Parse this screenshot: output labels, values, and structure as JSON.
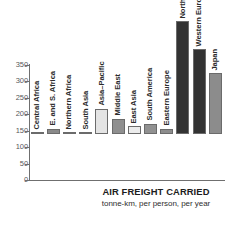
{
  "chart_data": {
    "type": "bar",
    "title": "AIR FREIGHT CARRIED",
    "subtitle": "tonne-km, per person, per year",
    "xlabel": "",
    "ylabel": "",
    "ylim": [
      0,
      350
    ],
    "yticks": [
      0,
      50,
      100,
      150,
      200,
      250,
      300,
      350
    ],
    "ytick_labels": [
      "0",
      "50",
      "100",
      "150",
      "200",
      "250",
      "300",
      "350"
    ],
    "grid": false,
    "legend": "none",
    "categories": [
      "Central Africa",
      "E. and S. Africa",
      "Northern Africa",
      "South Asia",
      "Asia–Pacific",
      "Middle East",
      "East Asia",
      "South America",
      "Eastern Europe",
      "North America",
      "Western Europe",
      "Japan"
    ],
    "values": [
      2,
      15,
      5,
      3,
      76,
      46,
      24,
      31,
      15,
      343,
      258,
      185
    ],
    "bar_colors": [
      "#8f8f8f",
      "#8a8a8a",
      "#e9e9e9",
      "#e9e9e9",
      "#e4e4e4",
      "#8f8f8f",
      "#ececec",
      "#919191",
      "#8d8d8d",
      "#333333",
      "#333333",
      "#8c8c8c"
    ]
  },
  "axis": {
    "tick_color": "#6f6f6f",
    "label_color": "#58585a"
  },
  "caption": {
    "title": "AIR FREIGHT CARRIED",
    "subtitle": "tonne-km, per person, per year"
  }
}
